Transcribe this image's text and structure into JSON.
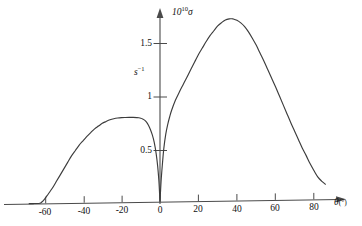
{
  "chart_data": {
    "type": "line",
    "title": "",
    "xlabel": "θ(°)",
    "ylabel": "10¹⁰σ",
    "y_unit_label": "s⁻¹",
    "xlim": [
      -70,
      92
    ],
    "ylim": [
      0,
      1.9
    ],
    "xticks": [
      -60,
      -40,
      -20,
      0,
      20,
      40,
      60,
      80
    ],
    "xtick_labels": [
      "-60",
      "-40",
      "-20",
      "0",
      "20",
      "40",
      "60",
      "80"
    ],
    "yticks": [
      0.5,
      1,
      1.5
    ],
    "ytick_labels": [
      "0.5",
      "1",
      "1.5"
    ],
    "grid": false,
    "legend": "none",
    "annotations": [
      "left lobe peak ≈ 0.79 at θ ≈ -11°",
      "sharp minimum to 0 at θ = 0°",
      "right lobe peak ≈ 1.70 at θ ≈ 37°"
    ],
    "series": [
      {
        "name": "10^10 sigma (s^-1)",
        "x": [
          -68,
          -66,
          -64,
          -63,
          -62,
          -61,
          -60,
          -58,
          -56,
          -54,
          -52,
          -50,
          -48,
          -46,
          -44,
          -42,
          -40,
          -38,
          -36,
          -34,
          -32,
          -30,
          -28,
          -26,
          -24,
          -22,
          -20,
          -18,
          -16,
          -14,
          -12,
          -11,
          -10,
          -9,
          -8,
          -7,
          -6,
          -5,
          -4,
          -3,
          -2,
          -1.2,
          -0.6,
          -0.2,
          0,
          0.2,
          0.6,
          1.2,
          2,
          3,
          4,
          5,
          6,
          8,
          10,
          12,
          14,
          16,
          18,
          20,
          22,
          24,
          26,
          28,
          30,
          32,
          34,
          36,
          37,
          38,
          40,
          42,
          44,
          46,
          48,
          50,
          52,
          54,
          56,
          58,
          60,
          62,
          64,
          66,
          68,
          70,
          72,
          74,
          76,
          78,
          80,
          82,
          84,
          86
        ],
        "y": [
          0,
          0,
          0,
          0,
          0.005,
          0.02,
          0.04,
          0.09,
          0.14,
          0.2,
          0.26,
          0.32,
          0.38,
          0.44,
          0.49,
          0.54,
          0.58,
          0.62,
          0.655,
          0.69,
          0.715,
          0.74,
          0.757,
          0.772,
          0.782,
          0.788,
          0.791,
          0.792,
          0.792,
          0.791,
          0.789,
          0.787,
          0.783,
          0.776,
          0.764,
          0.745,
          0.716,
          0.676,
          0.625,
          0.555,
          0.45,
          0.33,
          0.2,
          0.07,
          0,
          0.07,
          0.2,
          0.34,
          0.5,
          0.63,
          0.72,
          0.79,
          0.85,
          0.945,
          1.02,
          1.09,
          1.16,
          1.23,
          1.3,
          1.37,
          1.43,
          1.49,
          1.545,
          1.59,
          1.635,
          1.665,
          1.688,
          1.699,
          1.7,
          1.698,
          1.685,
          1.66,
          1.625,
          1.575,
          1.515,
          1.45,
          1.375,
          1.3,
          1.22,
          1.14,
          1.06,
          0.975,
          0.89,
          0.805,
          0.72,
          0.64,
          0.56,
          0.48,
          0.41,
          0.335,
          0.27,
          0.21,
          0.17,
          0.14
        ]
      }
    ]
  },
  "labels": {
    "y_axis_top": "10",
    "y_axis_exponent": "10",
    "y_axis_symbol": "σ",
    "y_unit_base": "s",
    "y_unit_exponent": "−1",
    "x_axis_symbol": "θ",
    "x_axis_unit": "(°)"
  },
  "colors": {
    "curve": "#3c3c3c",
    "axis": "#4a4a4a",
    "text": "#111111",
    "background": "#ffffff"
  }
}
